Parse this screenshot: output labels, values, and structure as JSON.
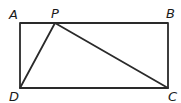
{
  "diagram": {
    "type": "geometry",
    "points": {
      "A": {
        "label": "A",
        "x": 20,
        "y": 23
      },
      "B": {
        "label": "B",
        "x": 168,
        "y": 23
      },
      "C": {
        "label": "C",
        "x": 168,
        "y": 88
      },
      "D": {
        "label": "D",
        "x": 20,
        "y": 88
      },
      "P": {
        "label": "P",
        "x": 55,
        "y": 23
      }
    },
    "segments": [
      "AB",
      "BC",
      "CD",
      "DA",
      "PD",
      "PC"
    ],
    "colors": {
      "stroke": "#2a2a2a",
      "text": "#1a1a1a",
      "background": "#ffffff"
    }
  }
}
